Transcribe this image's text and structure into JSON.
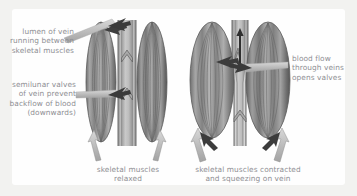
{
  "figure": {
    "background_color": "#f2f2f0",
    "card_color": "#fefefe",
    "text_color": "#8e8e93",
    "muscle_color": "#9a9a9a",
    "vein_color": "#b9b9b9",
    "arrow_color": "#9b9b9b",
    "dark_arrow_color": "#4a4a4a"
  },
  "labels": {
    "lumen": "lumen of vein\nrunning between\nskeletal muscles",
    "semilunar": "semilunar valves\nof vein prevent\nbackflow of blood\n(downwards)",
    "blood_flow": "blood flow\nthrough veins\nopens valves"
  },
  "captions": {
    "left": "skeletal muscles\nrelaxed",
    "right": "skeletal muscles contracted\nand squeezing on vein"
  },
  "panels": [
    {
      "id": "relaxed",
      "caption": "skeletal muscles\nrelaxed",
      "muscle_state": "relaxed",
      "vein_state": "open, wide lumen",
      "valve_count": 2,
      "valve_state": "closed cusps visible",
      "flow_arrows": 1
    },
    {
      "id": "contracted",
      "caption": "skeletal muscles contracted\nand squeezing on vein",
      "muscle_state": "contracted and bulging",
      "vein_state": "compressed, narrow lumen",
      "valve_count": 2,
      "valve_state": "open, blood pushed upward",
      "flow_arrows": 1
    }
  ],
  "annotations": {
    "upward_flow": "blood pushed upward through vein",
    "muscle_squeeze": "muscles squeeze inward on vein"
  }
}
